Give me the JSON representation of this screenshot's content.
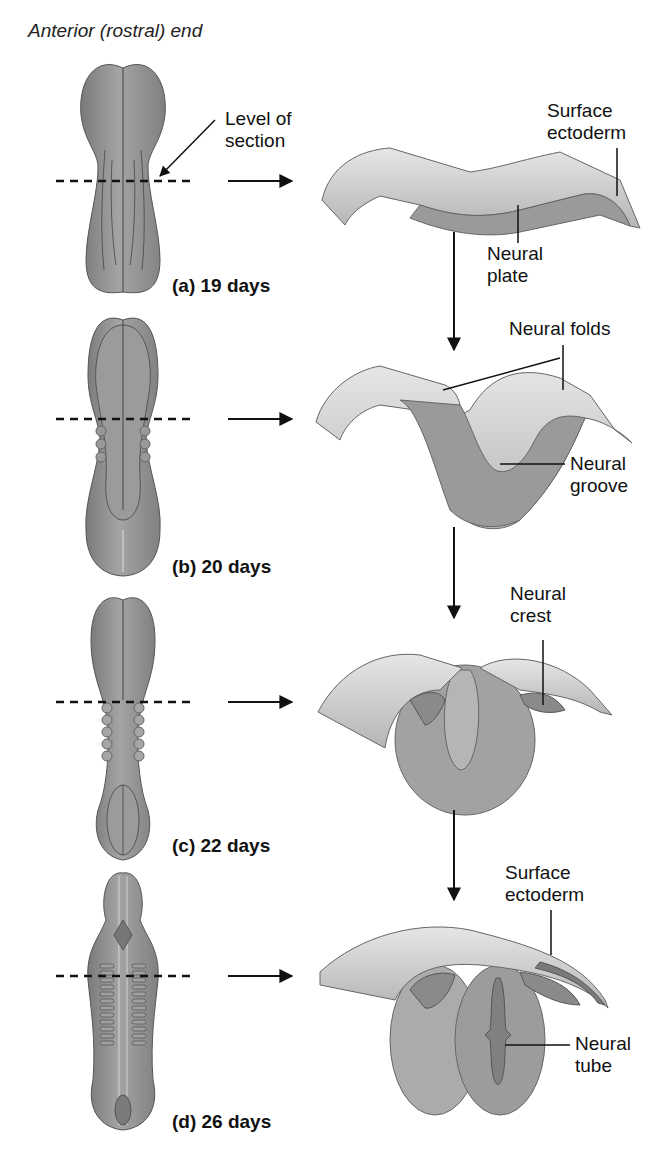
{
  "diagram": {
    "title": "Anterior (rostral) end",
    "colors": {
      "embryo_fill": "#8f8f8f",
      "embryo_dark": "#6e6e6e",
      "tissue_light": "#d6d6d6",
      "tissue_mid": "#a9a9a9",
      "tissue_dark": "#7c7c7c",
      "line": "#111111",
      "background": "#ffffff"
    },
    "stages": [
      {
        "id": "a",
        "label": "(a)  19 days",
        "section_labels": [
          "Surface\nectoderm",
          "Neural\nplate"
        ]
      },
      {
        "id": "b",
        "label": "(b)  20 days",
        "section_labels": [
          "Neural folds",
          "Neural\ngroove"
        ]
      },
      {
        "id": "c",
        "label": "(c)  22 days",
        "section_labels": [
          "Neural\ncrest"
        ]
      },
      {
        "id": "d",
        "label": "(d)  26 days",
        "section_labels": [
          "Surface\nectoderm",
          "Neural\ntube"
        ]
      }
    ],
    "annotations": {
      "level_of_section": "Level of\nsection"
    }
  }
}
